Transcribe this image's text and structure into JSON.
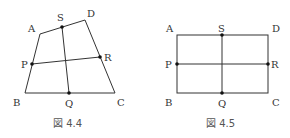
{
  "figures": [
    {
      "caption": "図 4.4",
      "shape": "quadrilateral",
      "vertices": {
        "A": [
          40,
          34
        ],
        "B": [
          25,
          93
        ],
        "C": [
          115,
          93
        ],
        "D": [
          85,
          20
        ]
      },
      "midpoints": {
        "P": [
          32,
          64
        ],
        "Q": [
          69,
          93
        ],
        "R": [
          100,
          57
        ],
        "S": [
          62,
          27
        ]
      },
      "labels": {
        "A": "A",
        "B": "B",
        "C": "C",
        "D": "D",
        "P": "P",
        "Q": "Q",
        "R": "R",
        "S": "S"
      }
    },
    {
      "caption": "図 4.5",
      "shape": "rectangle",
      "vertices": {
        "A": [
          177,
          35
        ],
        "B": [
          177,
          93
        ],
        "C": [
          268,
          93
        ],
        "D": [
          268,
          35
        ]
      },
      "midpoints": {
        "P": [
          177,
          64
        ],
        "Q": [
          222,
          93
        ],
        "R": [
          268,
          64
        ],
        "S": [
          222,
          35
        ]
      },
      "labels": {
        "A": "A",
        "B": "B",
        "C": "C",
        "D": "D",
        "P": "P",
        "Q": "Q",
        "R": "R",
        "S": "S"
      }
    }
  ],
  "colors": {
    "line": "#333333",
    "point": "#111111",
    "text": "#333333"
  }
}
